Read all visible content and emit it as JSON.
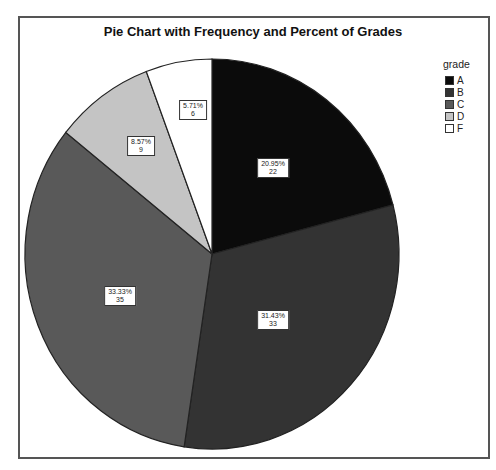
{
  "chart_data": {
    "type": "pie",
    "title": "Pie Chart with Frequency and Percent of Grades",
    "legend_title": "grade",
    "legend_position": "right",
    "categories": [
      "A",
      "B",
      "C",
      "D",
      "F"
    ],
    "values": [
      22,
      33,
      35,
      9,
      6
    ],
    "percents": [
      "20.95%",
      "31.43%",
      "33.33%",
      "8.57%",
      "5.71%"
    ],
    "colors": [
      "#0b0b0b",
      "#333333",
      "#595959",
      "#c4c4c4",
      "#ffffff"
    ],
    "start_angle": "12 o'clock",
    "direction": "clockwise"
  },
  "labels": [
    {
      "pct": "20.95%",
      "n": "22"
    },
    {
      "pct": "31.43%",
      "n": "33"
    },
    {
      "pct": "33.33%",
      "n": "35"
    },
    {
      "pct": "8.57%",
      "n": "9"
    },
    {
      "pct": "5.71%",
      "n": "6"
    }
  ]
}
